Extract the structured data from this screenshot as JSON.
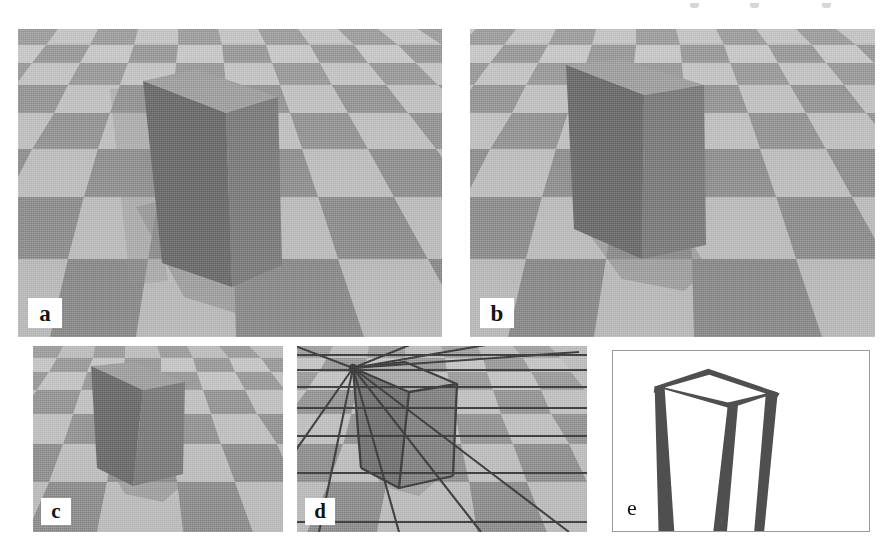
{
  "figure": {
    "background": "#ffffff",
    "width": 895,
    "height": 560,
    "kind": "multi-panel figure of a rendered box on a checkerboard ground plane"
  },
  "palette": {
    "checker_light": "#b9b9b9",
    "checker_dark": "#8b8b8b",
    "checker_light_far": "#c6c6c6",
    "checker_dark_far": "#9a9a9a",
    "box_left_face": "#6d6d6d",
    "box_right_face": "#7a7a7a",
    "box_top_face": "#9c9c9c",
    "box_shadow": "#7e7e7e",
    "wire_line": "#4a4a4a",
    "panel_e_border": "#9a9a9a",
    "sketch_ink": "#4f4f4f",
    "label_text": "#141414",
    "chip_background": "#ffffff"
  },
  "panels": [
    {
      "id": "a",
      "label": "a",
      "label_style": "white-chip",
      "x": 18,
      "y": 29,
      "w": 424,
      "h": 308,
      "content": "photorealistic box standing upright on checkerboard floor, wide view"
    },
    {
      "id": "b",
      "label": "b",
      "label_style": "white-chip",
      "x": 470,
      "y": 29,
      "w": 405,
      "h": 308,
      "content": "same box slightly rotated / shifted on checkerboard floor"
    },
    {
      "id": "c",
      "label": "c",
      "label_style": "white-chip",
      "x": 33,
      "y": 346,
      "w": 250,
      "h": 186,
      "content": "closer view of tilted box on checkerboard floor"
    },
    {
      "id": "d",
      "label": "d",
      "label_style": "white-chip",
      "x": 297,
      "y": 346,
      "w": 290,
      "h": 186,
      "content": "same view as c with recovered wireframe grid and box edges overlaid"
    },
    {
      "id": "e",
      "label": "e",
      "label_style": "plain-on-white",
      "x": 612,
      "y": 350,
      "w": 258,
      "h": 182,
      "content": "line-drawing / edge sketch of the box with tapered strokes on white background"
    }
  ],
  "top_remnant": {
    "description": "faint clipped descenders of text from line above the figure crop",
    "marks": 3
  }
}
